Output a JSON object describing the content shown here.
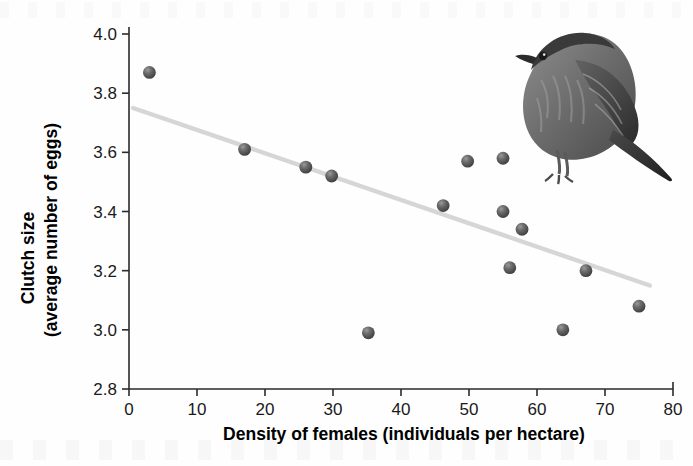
{
  "figure": {
    "name": "clutch-size-vs-female-density-scatter",
    "background_color": "#fefefe",
    "marker_color": "#5a5a5a",
    "trendline_color": "#d6d6d6",
    "axis_color": "#2b2b2b"
  },
  "illustration": {
    "name": "sparrow-illustration",
    "description": "Grayscale drawing of a streaked sparrow perched, facing left, long tail to the right"
  },
  "chart_data": {
    "type": "scatter",
    "title": "",
    "xlabel": "Density of females (individuals per hectare)",
    "ylabel": "Clutch size (average number of eggs)",
    "ylabel_line1": "Clutch size",
    "ylabel_line2": "(average number of eggs)",
    "xlim": [
      0,
      80
    ],
    "ylim": [
      2.8,
      4.0
    ],
    "xticks": [
      0,
      10,
      20,
      30,
      40,
      50,
      60,
      70,
      80
    ],
    "yticks": [
      "2.8",
      "3.0",
      "3.2",
      "3.4",
      "3.6",
      "3.8",
      "4.0"
    ],
    "xtick_labels": [
      "0",
      "10",
      "20",
      "30",
      "40",
      "50",
      "60",
      "70",
      "80"
    ],
    "grid": false,
    "legend": false,
    "x": [
      3.0,
      17.0,
      26.0,
      29.8,
      35.2,
      46.2,
      49.8,
      55.0,
      55.2,
      57.8,
      56.0,
      63.8,
      67.2,
      75.0
    ],
    "y": [
      3.87,
      3.61,
      3.55,
      3.52,
      2.99,
      3.42,
      3.57,
      3.58,
      3.4,
      3.34,
      3.21,
      3.0,
      3.2,
      3.08
    ],
    "points": [
      {
        "x": 3.0,
        "y": 3.87
      },
      {
        "x": 17.0,
        "y": 3.61
      },
      {
        "x": 26.0,
        "y": 3.55
      },
      {
        "x": 29.8,
        "y": 3.52
      },
      {
        "x": 35.2,
        "y": 2.99
      },
      {
        "x": 46.2,
        "y": 3.42
      },
      {
        "x": 49.8,
        "y": 3.57
      },
      {
        "x": 55.0,
        "y": 3.58
      },
      {
        "x": 55.0,
        "y": 3.4
      },
      {
        "x": 57.8,
        "y": 3.34
      },
      {
        "x": 56.0,
        "y": 3.21
      },
      {
        "x": 63.8,
        "y": 3.0
      },
      {
        "x": 67.2,
        "y": 3.2
      },
      {
        "x": 75.0,
        "y": 3.08
      }
    ],
    "trendline": {
      "type": "linear-fit",
      "x_start": 0.6,
      "y_start": 3.75,
      "x_end": 76.6,
      "y_end": 3.15
    }
  }
}
